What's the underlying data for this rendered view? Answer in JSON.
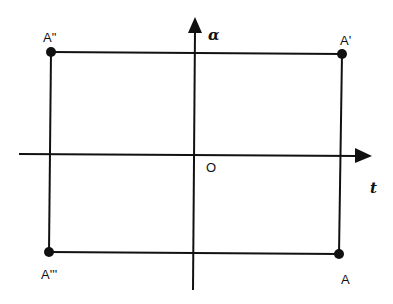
{
  "diagram": {
    "type": "phase-plane rectangle",
    "axes": {
      "horizontal": {
        "label": "t"
      },
      "vertical": {
        "label": "α"
      },
      "origin_label": "O"
    },
    "points": [
      {
        "id": "A",
        "label": "A",
        "quadrant": "bottom-right"
      },
      {
        "id": "A1",
        "label": "A'",
        "quadrant": "top-right"
      },
      {
        "id": "A2",
        "label": "A\"",
        "quadrant": "top-left"
      },
      {
        "id": "A3",
        "label": "A'''",
        "quadrant": "bottom-left"
      }
    ],
    "colors": {
      "line": "#111111",
      "background": "#ffffff"
    }
  }
}
